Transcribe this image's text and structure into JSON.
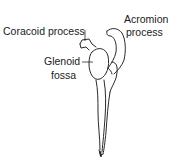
{
  "diagram": {
    "labels": {
      "coracoid": "Coracoid process",
      "acromion_line1": "Acromion",
      "acromion_line2": "process",
      "glenoid_line1": "Glenoid",
      "glenoid_line2": "fossa"
    },
    "colors": {
      "line": "#2a2a2a",
      "text": "#1a1a1a",
      "background": "#ffffff"
    }
  }
}
